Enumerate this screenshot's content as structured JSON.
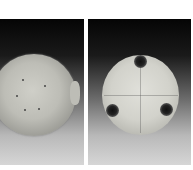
{
  "image": {
    "description": "Two photographs of a crackle-glazed celadon ceramic bowl on a black-to-grey gradient background",
    "panels": [
      {
        "id": "left",
        "view": "top view of bowl interior with small side lug"
      },
      {
        "id": "right",
        "view": "bottom view of bowl showing three dark round feet"
      }
    ],
    "colors": {
      "background_top": "#050505",
      "background_bottom": "#d6d6d6",
      "glaze": "#d2d2cb",
      "feet": "#1a1a1a",
      "page": "#ffffff"
    }
  }
}
